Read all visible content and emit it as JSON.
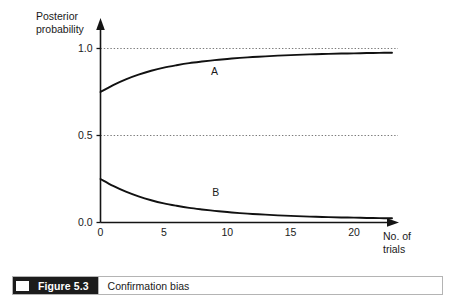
{
  "chart_data": {
    "type": "line",
    "title": "",
    "xlabel": "No. of trials",
    "xlabel_lines": [
      "No. of",
      "trials"
    ],
    "ylabel": "Posterior probability",
    "ylabel_lines": [
      "Posterior",
      "probability"
    ],
    "xlim": [
      0,
      23
    ],
    "ylim": [
      0,
      1.05
    ],
    "xticks": [
      0,
      5,
      10,
      15,
      20
    ],
    "xtick_labels": [
      "0",
      "5",
      "10",
      "15",
      "20"
    ],
    "yticks": [
      0.0,
      0.5,
      1.0
    ],
    "ytick_labels": [
      "0.0",
      "0.5",
      "1.0"
    ],
    "grid": "horizontal dotted at y = 0.5 and y = 1.0",
    "gridlines": [
      0.5,
      1.0
    ],
    "legend": "inline curve labels",
    "series": [
      {
        "name": "A",
        "label": "A",
        "label_x": 9.0,
        "label_y": 0.845,
        "x": [
          0,
          1,
          2,
          3,
          4,
          5,
          6,
          7,
          8,
          9,
          10,
          11,
          12,
          13,
          14,
          15,
          16,
          17,
          18,
          19,
          20,
          21,
          22,
          23
        ],
        "values": [
          0.75,
          0.79,
          0.823,
          0.85,
          0.872,
          0.89,
          0.904,
          0.916,
          0.925,
          0.933,
          0.94,
          0.946,
          0.951,
          0.955,
          0.959,
          0.962,
          0.965,
          0.967,
          0.969,
          0.971,
          0.972,
          0.974,
          0.975,
          0.976
        ]
      },
      {
        "name": "B",
        "label": "B",
        "label_x": 9.1,
        "label_y": 0.155,
        "x": [
          0,
          1,
          2,
          3,
          4,
          5,
          6,
          7,
          8,
          9,
          10,
          11,
          12,
          13,
          14,
          15,
          16,
          17,
          18,
          19,
          20,
          21,
          22,
          23
        ],
        "values": [
          0.25,
          0.21,
          0.177,
          0.15,
          0.128,
          0.11,
          0.096,
          0.084,
          0.075,
          0.067,
          0.06,
          0.054,
          0.049,
          0.045,
          0.041,
          0.038,
          0.035,
          0.033,
          0.031,
          0.029,
          0.028,
          0.026,
          0.025,
          0.024
        ]
      }
    ],
    "axis_arrows": {
      "x_axis": "arrow at right end",
      "y_axis": "arrow at top end"
    },
    "colors": {
      "curve": "#111111",
      "axis": "#141414",
      "gridline": "#6b6b6b",
      "background": "#ffffff"
    }
  },
  "caption": {
    "figure_label": "Figure 5.3",
    "text": "Confirmation bias"
  }
}
